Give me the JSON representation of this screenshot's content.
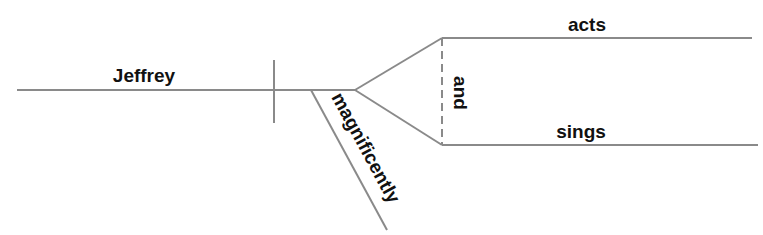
{
  "diagram": {
    "type": "sentence-diagram",
    "sentence": "Jeffrey acts and sings magnificently",
    "subject": "Jeffrey",
    "predicates": [
      "acts",
      "sings"
    ],
    "conjunction": "and",
    "modifier": "magnificently",
    "line_color": "#8a8a8a",
    "text_color": "#111111"
  }
}
